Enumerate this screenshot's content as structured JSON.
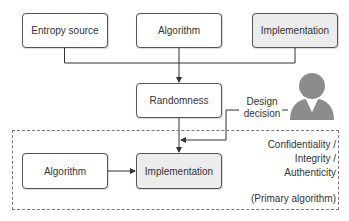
{
  "diagram": {
    "top_row": [
      {
        "id": "entropy_source",
        "label": "Entropy source",
        "fill": "#ffffff"
      },
      {
        "id": "algorithm_top",
        "label": "Algorithm",
        "fill": "#ffffff"
      },
      {
        "id": "implementation_top",
        "label": "Implementation",
        "fill": "#ececec"
      }
    ],
    "randomness": {
      "label": "Randomness",
      "fill": "#ffffff"
    },
    "design_decision": {
      "line1": "Design",
      "line2": "decision"
    },
    "person_icon": "person-icon",
    "primary_group": {
      "algorithm": {
        "label": "Algorithm",
        "fill": "#ffffff"
      },
      "implementation": {
        "label": "Implementation",
        "fill": "#ececec"
      },
      "annotation": {
        "line1": "Confidentiality /",
        "line2": "Integrity /",
        "line3": "Authenticity",
        "line4": "(Primary algorithm)"
      }
    },
    "colors": {
      "line": "#333333",
      "box_border": "#555555",
      "gray_fill": "#ececec",
      "person": "#8c8c8c"
    }
  }
}
